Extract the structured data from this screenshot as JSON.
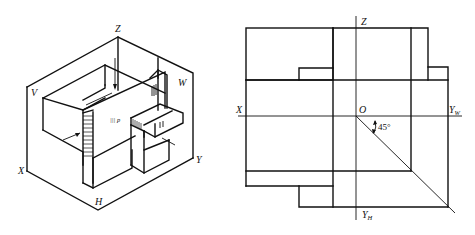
{
  "isometric_view": {
    "labels": {
      "z": "Z",
      "v": "V",
      "w": "W",
      "x": "X",
      "y": "Y",
      "h": "H"
    },
    "marks": {
      "front_face": "||| p"
    }
  },
  "orthographic_view": {
    "labels": {
      "z": "Z",
      "x": "X",
      "o": "O",
      "yw_main": "Y",
      "yw_sub": "W",
      "yh_main": "Y",
      "yh_sub": "H",
      "angle": "45°"
    }
  }
}
